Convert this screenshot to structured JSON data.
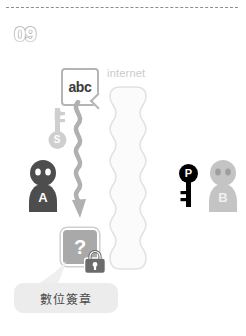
{
  "slide": {
    "number": "09"
  },
  "document": {
    "label": "abc",
    "icon": "document-icon"
  },
  "network": {
    "label": "internet"
  },
  "signing_key": {
    "top_letter": "F",
    "bow_letter": "S",
    "icon": "key-icon"
  },
  "sender": {
    "letter": "A",
    "icon": "person-icon"
  },
  "receiver": {
    "letter": "B",
    "icon": "person-icon"
  },
  "public_key": {
    "letter": "P",
    "icon": "key-icon"
  },
  "encrypted": {
    "label": "?",
    "lock_icon": "padlock-icon"
  },
  "callout": {
    "text": "數位簽章"
  },
  "colors": {
    "person_a": "#4d4d4d",
    "person_b": "#c4c4c4",
    "key_black": "#000000",
    "key_grey": "#cfcfcf",
    "arrow": "#b0b0b0",
    "locked_box": "#a9a9a9",
    "internet_outline": "#e2e2e2",
    "callout_bg": "#ececec",
    "rule": "#8d8d8d"
  }
}
